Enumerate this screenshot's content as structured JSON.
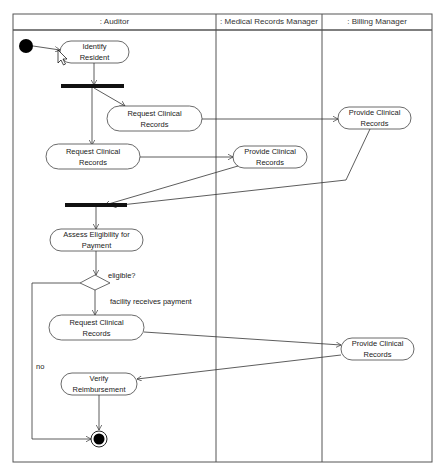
{
  "diagram": {
    "type": "uml-activity-diagram",
    "swimlanes": [
      {
        "id": "auditor",
        "label": ": Auditor"
      },
      {
        "id": "mrm",
        "label": ": Medical Records Manager"
      },
      {
        "id": "billing",
        "label": ": Billing Manager"
      }
    ],
    "nodes": {
      "identify_resident": {
        "label": "Identify\nResident",
        "lane": "auditor"
      },
      "request_records_1": {
        "label": "Request Clinical\nRecords",
        "lane": "auditor"
      },
      "request_records_2": {
        "label": "Request Clinical\nRecords",
        "lane": "auditor"
      },
      "provide_records_mrm": {
        "label": "Provide Clinical\nRecords",
        "lane": "mrm"
      },
      "provide_records_billing_1": {
        "label": "Provide Clinical\nRecords",
        "lane": "billing"
      },
      "assess_eligibility": {
        "label": "Assess Eligibility for\nPayment",
        "lane": "auditor"
      },
      "request_records_3": {
        "label": "Request Clinical\nRecords",
        "lane": "auditor"
      },
      "provide_records_billing_2": {
        "label": "Provide Clinical\nRecords",
        "lane": "billing"
      },
      "verify_reimbursement": {
        "label": "Verify\nReimbursement",
        "lane": "auditor"
      }
    },
    "decision": {
      "label": "eligible?"
    },
    "guards": {
      "yes": "facility receives payment",
      "no": "no"
    },
    "edges": [
      [
        "initial",
        "identify_resident"
      ],
      [
        "identify_resident",
        "fork"
      ],
      [
        "fork",
        "request_records_1"
      ],
      [
        "fork",
        "request_records_2"
      ],
      [
        "request_records_1",
        "provide_records_billing_1"
      ],
      [
        "request_records_2",
        "provide_records_mrm"
      ],
      [
        "provide_records_mrm",
        "join"
      ],
      [
        "provide_records_billing_1",
        "join"
      ],
      [
        "join",
        "assess_eligibility"
      ],
      [
        "assess_eligibility",
        "decision"
      ],
      [
        "decision",
        "request_records_3"
      ],
      [
        "decision",
        "final"
      ],
      [
        "request_records_3",
        "provide_records_billing_2"
      ],
      [
        "provide_records_billing_2",
        "verify_reimbursement"
      ],
      [
        "verify_reimbursement",
        "final"
      ]
    ]
  }
}
